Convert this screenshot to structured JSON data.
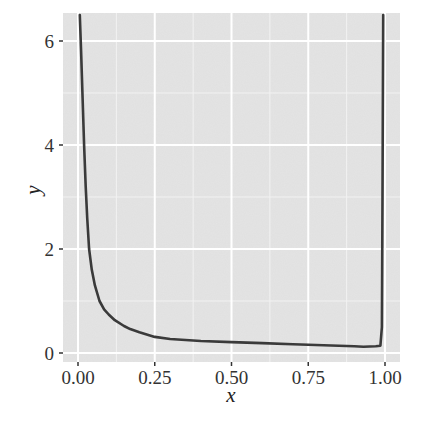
{
  "chart_data": {
    "type": "line",
    "title": "",
    "xlabel": "x",
    "ylabel": "y",
    "xlim": [
      -0.045,
      1.05
    ],
    "ylim": [
      -0.17,
      6.5
    ],
    "x_ticks": [
      0.0,
      0.25,
      0.5,
      0.75,
      1.0
    ],
    "x_tick_labels": [
      "0.00",
      "0.25",
      "0.50",
      "0.75",
      "1.00"
    ],
    "y_ticks": [
      0,
      2,
      4,
      6
    ],
    "y_tick_labels": [
      "0",
      "2",
      "4",
      "6"
    ],
    "grid": true,
    "legend": null,
    "series": [
      {
        "name": "y",
        "x": [
          0.006,
          0.01,
          0.015,
          0.02,
          0.025,
          0.03,
          0.036,
          0.045,
          0.055,
          0.07,
          0.085,
          0.1,
          0.12,
          0.15,
          0.17,
          0.2,
          0.25,
          0.3,
          0.4,
          0.5,
          0.6,
          0.7,
          0.75,
          0.8,
          0.9,
          0.93,
          0.97,
          0.985,
          0.99,
          0.992,
          0.994
        ],
        "y": [
          6.5,
          5.8,
          4.9,
          4.0,
          3.2,
          2.6,
          2.0,
          1.6,
          1.3,
          1.0,
          0.84,
          0.74,
          0.63,
          0.52,
          0.46,
          0.4,
          0.31,
          0.27,
          0.23,
          0.21,
          0.19,
          0.17,
          0.16,
          0.15,
          0.13,
          0.12,
          0.13,
          0.14,
          0.5,
          3.0,
          6.5
        ]
      }
    ]
  },
  "colors": {
    "panel_background": "#e4e4e4",
    "grid_major": "#ffffff",
    "grid_minor": "#f2f2f2",
    "line": "#3a3a3a",
    "tick_text": "#333333"
  },
  "layout": {
    "panel": {
      "left": 63,
      "top": 13,
      "right": 400,
      "bottom": 362
    },
    "x_map": {
      "px0": 78,
      "px_per_unit": 307
    },
    "y_map": {
      "px0": 353,
      "px_per_unit": 52
    }
  }
}
